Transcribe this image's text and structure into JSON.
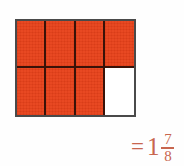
{
  "figure": {
    "kind": "fraction-area-model",
    "background_color": "#fefefe"
  },
  "grid": {
    "columns": 4,
    "rows": 2,
    "total_cells": 8,
    "shaded_cells": 7,
    "unshaded_cells": 1,
    "fill_color": "#e8411a",
    "empty_color": "#ffffff",
    "inner_line_color": "#3a1208",
    "outer_border_color": "#4a4a4a",
    "cells": [
      {
        "id": "r1c1",
        "state": "shaded"
      },
      {
        "id": "r1c2",
        "state": "shaded"
      },
      {
        "id": "r1c3",
        "state": "shaded"
      },
      {
        "id": "r1c4",
        "state": "shaded"
      },
      {
        "id": "r2c1",
        "state": "shaded"
      },
      {
        "id": "r2c2",
        "state": "shaded"
      },
      {
        "id": "r2c3",
        "state": "shaded"
      },
      {
        "id": "r2c4",
        "state": "empty"
      }
    ]
  },
  "result": {
    "equals": "=",
    "whole": "1",
    "numerator": "7",
    "denominator": "8",
    "text_color": "#c8664f"
  },
  "chart_data": {
    "type": "bar",
    "title": "",
    "xlabel": "",
    "ylabel": "",
    "categories": [
      "shaded",
      "unshaded"
    ],
    "values": [
      7,
      1
    ],
    "ylim": [
      0,
      8
    ]
  }
}
